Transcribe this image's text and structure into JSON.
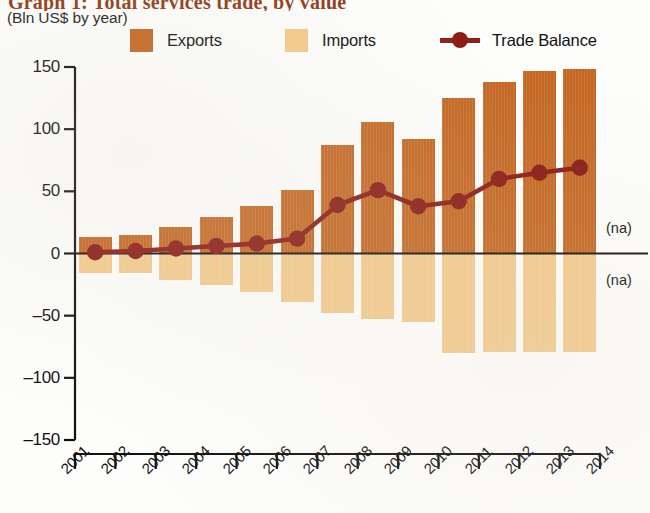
{
  "title": "Graph 1: Total services trade, by value",
  "subtitle": "(Bln US$ by year)",
  "colors": {
    "exports": "#c3651f",
    "imports": "#f3c98a",
    "balance": "#8a1b15",
    "axis": "#111111",
    "title": "#8c3b17"
  },
  "legend": {
    "items": [
      {
        "label": "Exports",
        "marker": "swatch-exports"
      },
      {
        "label": "Imports",
        "marker": "swatch-imports"
      },
      {
        "label": "Trade Balance",
        "marker": "line-marker-balance"
      }
    ]
  },
  "annotations": [
    {
      "text": "(na)",
      "value": 20
    },
    {
      "text": "(na)",
      "value": -22
    }
  ],
  "chart_data": {
    "type": "bar",
    "title": "Graph 1: Total services trade, by value",
    "subtitle": "(Bln US$ by year)",
    "xlabel": "",
    "ylabel": "Bln US$",
    "ylim": [
      -150,
      150
    ],
    "yticks": [
      150,
      100,
      50,
      0,
      -50,
      -100,
      -150
    ],
    "ytick_labels": [
      "150",
      "100",
      "50",
      "0",
      "–50",
      "–100",
      "–150"
    ],
    "xticks": [
      "2001",
      "2002",
      "2003",
      "2004",
      "2005",
      "2006",
      "2007",
      "2008",
      "2009",
      "2010",
      "2011",
      "2012",
      "2013",
      "2014"
    ],
    "categories": [
      "2001",
      "2002",
      "2003",
      "2004",
      "2005",
      "2006",
      "2007",
      "2008",
      "2009",
      "2010",
      "2011",
      "2012",
      "2013"
    ],
    "grid": false,
    "legend_position": "top",
    "series": [
      {
        "name": "Exports",
        "type": "bar",
        "color": "#c3651f",
        "values": [
          13,
          15,
          21,
          29,
          38,
          51,
          87,
          106,
          92,
          125,
          138,
          147,
          148
        ]
      },
      {
        "name": "Imports",
        "type": "bar",
        "color": "#f3c98a",
        "values": [
          -16,
          -16,
          -21,
          -25,
          -31,
          -39,
          -48,
          -53,
          -55,
          -80,
          -79,
          -79,
          -79
        ]
      },
      {
        "name": "Trade Balance",
        "type": "line",
        "color": "#8a1b15",
        "values": [
          1,
          2,
          4,
          6,
          8,
          12,
          39,
          51,
          38,
          42,
          60,
          65,
          69
        ]
      }
    ]
  }
}
